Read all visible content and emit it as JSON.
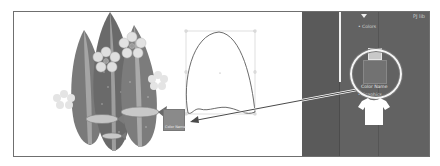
{
  "canvas": {
    "artwork_name": "Surfboards illustration",
    "selected_shape": "Surfboard outline path",
    "bounding_box": true
  },
  "panel": {
    "top_label": "PJ lib",
    "section_colors": "• Colors",
    "section_graphics": "• Graphics",
    "swatch_label": "Color Name",
    "graphic_item": "t-shirt"
  },
  "thumbnail": {
    "label": "Color Name"
  },
  "colors": {
    "panel_bg": "#5a5a5a",
    "artboard_bg": "#ffffff",
    "callout_ring": "#f5f5f5"
  }
}
